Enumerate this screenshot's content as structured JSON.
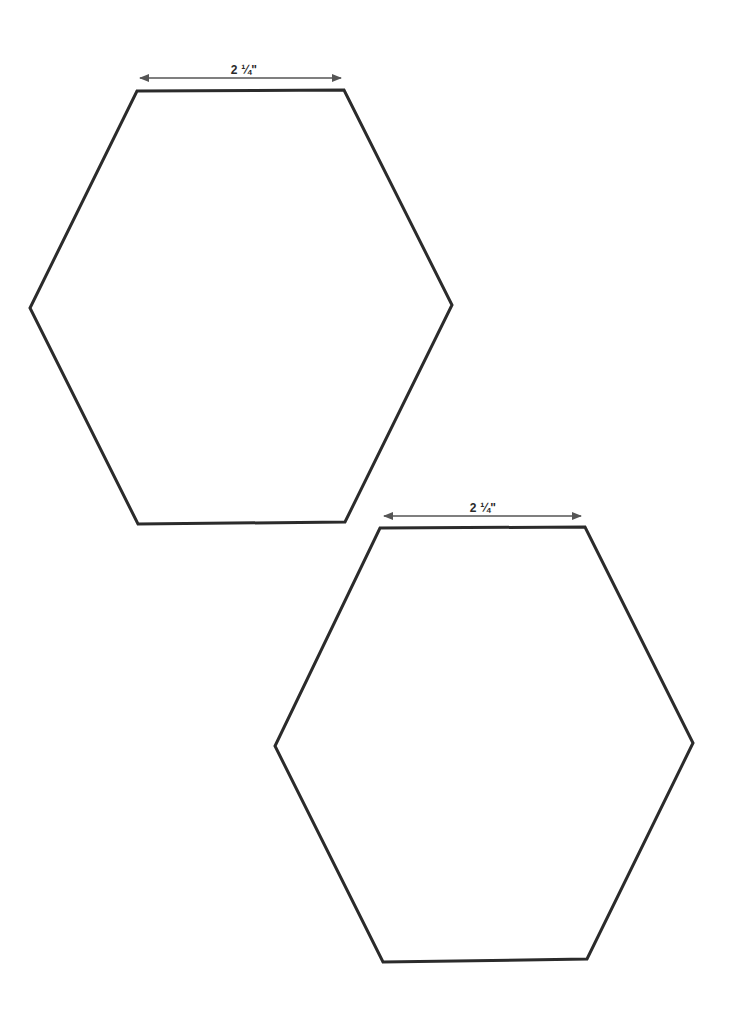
{
  "template": {
    "shape": "hexagon",
    "count": 2,
    "stroke_color": "#2b2b2b",
    "arrow_color": "#555555",
    "background": "#ffffff"
  },
  "hexagons": [
    {
      "id": "hexagon-1",
      "points": [
        [
          137,
          91
        ],
        [
          344,
          90
        ],
        [
          452,
          305
        ],
        [
          345,
          522
        ],
        [
          138,
          524
        ],
        [
          30,
          308
        ]
      ],
      "dimension": {
        "label": "2 ¼\"",
        "arrow_start": [
          140,
          78
        ],
        "arrow_end": [
          341,
          78
        ],
        "label_pos": [
          244,
          63
        ]
      }
    },
    {
      "id": "hexagon-2",
      "points": [
        [
          380,
          528
        ],
        [
          585,
          527
        ],
        [
          693,
          743
        ],
        [
          587,
          959
        ],
        [
          383,
          962
        ],
        [
          275,
          746
        ]
      ],
      "dimension": {
        "label": "2 ¼\"",
        "arrow_start": [
          384,
          516
        ],
        "arrow_end": [
          581,
          516
        ],
        "label_pos": [
          483,
          501
        ]
      }
    }
  ]
}
